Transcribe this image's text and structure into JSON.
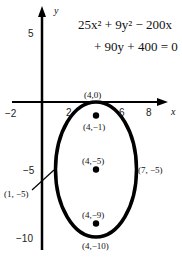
{
  "equation": {
    "line1": "25x² + 9y² − 200x",
    "line2": "+ 90y + 400 = 0"
  },
  "axes": {
    "x_label": "x",
    "y_label": "y",
    "x_ticks": [
      "−2",
      "2",
      "6",
      "8"
    ],
    "y_ticks": [
      "5",
      "−5",
      "−10"
    ]
  },
  "points": {
    "top_vertex": "(4,0)",
    "focus_upper": "(4,−1)",
    "center": "(4,−5)",
    "focus_lower": "(4,−9)",
    "bottom_vertex": "(4,−10)",
    "left_covertex": "(1, −5)",
    "right_covertex": "(7, −5)"
  },
  "ellipse": {
    "center": [
      4,
      -5
    ],
    "semi_major_vertical": 5,
    "semi_minor_horizontal": 3
  }
}
